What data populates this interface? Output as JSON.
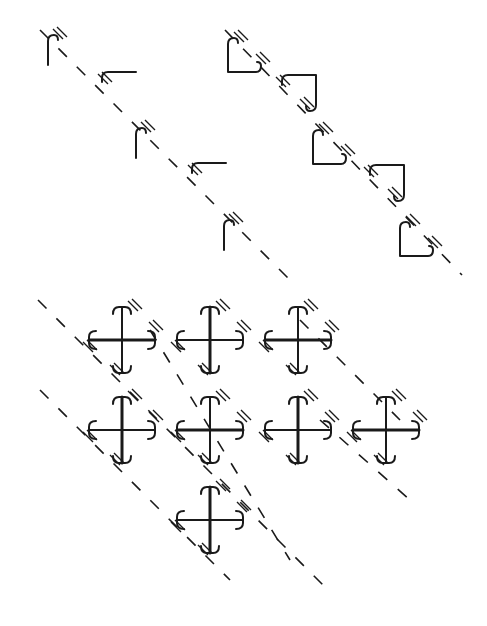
{
  "diagram": {
    "background": "#ffffff",
    "ink": "#1a1a1a",
    "hook_frieze": {
      "axis": {
        "x1": 40,
        "y1": 30,
        "x2": 290,
        "y2": 280
      },
      "motifs": [
        {
          "type": "hook-vertical",
          "x": 48,
          "y": 35
        },
        {
          "type": "hook-horizontal",
          "x": 100,
          "y": 72
        },
        {
          "type": "hook-vertical",
          "x": 136,
          "y": 128
        },
        {
          "type": "hook-horizontal",
          "x": 190,
          "y": 163
        },
        {
          "type": "hook-vertical",
          "x": 224,
          "y": 220
        }
      ]
    },
    "square_frieze": {
      "axis": {
        "x1": 225,
        "y1": 30,
        "x2": 462,
        "y2": 275
      },
      "motifs": [
        {
          "type": "square-open-tr",
          "x": 228,
          "y": 38
        },
        {
          "type": "square-open-bl",
          "x": 280,
          "y": 75
        },
        {
          "type": "square-open-tr",
          "x": 313,
          "y": 130
        },
        {
          "type": "square-open-bl",
          "x": 368,
          "y": 165
        },
        {
          "type": "square-open-tr",
          "x": 400,
          "y": 222
        }
      ]
    },
    "cross_lattice": {
      "axes": [
        {
          "x1": 38,
          "y1": 300,
          "x2": 330,
          "y2": 592
        },
        {
          "x1": 40,
          "y1": 390,
          "x2": 230,
          "y2": 580
        },
        {
          "x1": 150,
          "y1": 330,
          "x2": 290,
          "y2": 560
        },
        {
          "x1": 300,
          "y1": 320,
          "x2": 400,
          "y2": 420
        },
        {
          "x1": 320,
          "y1": 420,
          "x2": 410,
          "y2": 500
        }
      ],
      "crosses": [
        {
          "cx": 122,
          "cy": 340
        },
        {
          "cx": 210,
          "cy": 340
        },
        {
          "cx": 298,
          "cy": 340
        },
        {
          "cx": 122,
          "cy": 430
        },
        {
          "cx": 210,
          "cy": 430
        },
        {
          "cx": 298,
          "cy": 430
        },
        {
          "cx": 386,
          "cy": 430
        },
        {
          "cx": 210,
          "cy": 520
        }
      ]
    }
  }
}
